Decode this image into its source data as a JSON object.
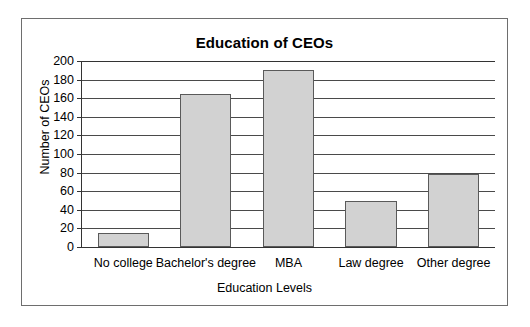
{
  "chart_data": {
    "type": "bar",
    "title": "Education of CEOs",
    "xlabel": "Education Levels",
    "ylabel": "Number of CEOs",
    "categories": [
      "No college",
      "Bachelor's degree",
      "MBA",
      "Law degree",
      "Other degree"
    ],
    "values": [
      15,
      165,
      190,
      50,
      79
    ],
    "ylim": [
      0,
      200
    ],
    "ytick_step": 20,
    "yticks": [
      0,
      20,
      40,
      60,
      80,
      100,
      120,
      140,
      160,
      180,
      200
    ],
    "ytick_labels": [
      "0",
      "20",
      "40",
      "60",
      "80",
      "100",
      "120",
      "140",
      "160",
      "180",
      "200"
    ],
    "grid": true,
    "grid_axis": "y",
    "legend": false,
    "bar_fill_color": "#d2d2d2",
    "bar_edge_color": "#5a5a5a",
    "axis_color": "#333333",
    "frame_color": "#6e6e6e",
    "text_color": "#000000",
    "background_color": "#ffffff"
  }
}
